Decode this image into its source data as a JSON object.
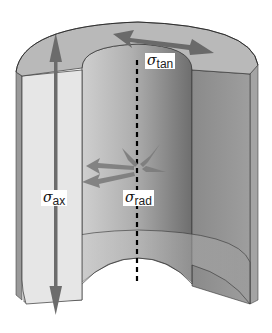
{
  "diagram": {
    "labels": {
      "tangential": {
        "symbol": "σ",
        "subscript": "tan"
      },
      "axial": {
        "symbol": "σ",
        "subscript": "ax"
      },
      "radial": {
        "symbol": "σ",
        "subscript": "rad"
      }
    },
    "colors": {
      "background": "#ffffff",
      "top_face": "#b8b8b8",
      "left_cut_face": "#e4e4e4",
      "inner_wall_light": "#c6c6c6",
      "inner_wall_dark": "#7a7a7a",
      "right_wall": "#8e8e8e",
      "arrow": "#6f6f6f",
      "axis": "#000000",
      "outline": "#333333"
    }
  }
}
